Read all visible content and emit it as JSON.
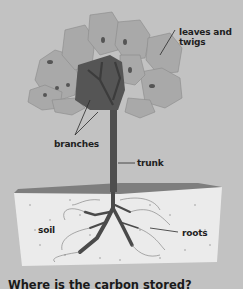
{
  "diagram": {
    "labels": {
      "leaves": "leaves and twigs",
      "leaves_line1": "leaves and",
      "leaves_line2": "twigs",
      "branches": "branches",
      "trunk": "trunk",
      "soil": "soil",
      "roots": "roots"
    },
    "question": "Where is the carbon stored?",
    "colors": {
      "background": "#c2c2c2",
      "canopy": "#a8a8a8",
      "canopy_dark": "#555555",
      "trunk": "#4a4a4a",
      "soil": "#ebebeb",
      "ground": "#7a7a7a"
    }
  }
}
